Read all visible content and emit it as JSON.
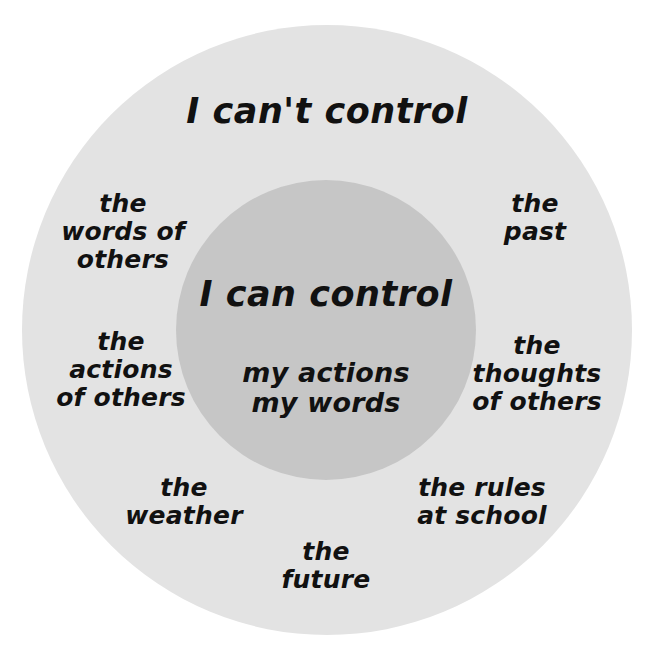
{
  "diagram": {
    "type": "circle-of-control",
    "background_color": "#ffffff",
    "outer_circle": {
      "label": "I can't control",
      "fill_color": "#e3e3e3",
      "items": [
        {
          "id": "words-of-others",
          "text": "the\nwords of\nothers",
          "position": "left-upper"
        },
        {
          "id": "actions-of-others",
          "text": "the\nactions\nof others",
          "position": "left-lower"
        },
        {
          "id": "the-past",
          "text": "the\npast",
          "position": "right-upper"
        },
        {
          "id": "thoughts-of-others",
          "text": "the\nthoughts\nof others",
          "position": "right-lower"
        },
        {
          "id": "the-weather",
          "text": "the\nweather",
          "position": "bottom-left"
        },
        {
          "id": "rules-at-school",
          "text": "the rules\nat school",
          "position": "bottom-right"
        },
        {
          "id": "the-future",
          "text": "the\nfuture",
          "position": "bottom-center"
        }
      ]
    },
    "inner_circle": {
      "label": "I can control",
      "fill_color": "#c6c6c6",
      "items": [
        {
          "id": "my-actions",
          "text": "my actions"
        },
        {
          "id": "my-words",
          "text": "my words"
        }
      ],
      "items_text": "my actions\nmy words"
    }
  }
}
